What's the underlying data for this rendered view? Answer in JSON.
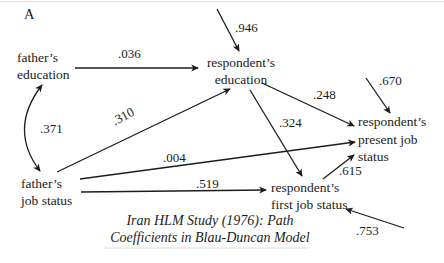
{
  "panel_label": "A",
  "caption": "Iran HLM Study (1976): Path\nCoefficients in Blau-Duncan Model",
  "nodes": {
    "fathers_education": {
      "label": "father’s\neducation"
    },
    "respondents_education": {
      "label": "respondent’s\neducation"
    },
    "respondents_present_job_status": {
      "label": "respondent’s\npresent job\nstatus"
    },
    "fathers_job_status": {
      "label": "father’s\njob status"
    },
    "respondents_first_job_status": {
      "label": "respondent’s\nfirst job status"
    }
  },
  "edges": [
    {
      "from": "father’s education",
      "to": "respondent’s education",
      "coef": ".036",
      "type": "path"
    },
    {
      "from": "residual",
      "to": "respondent’s education",
      "coef": ".946",
      "type": "residual"
    },
    {
      "from": "father’s job status",
      "to": "respondent’s education",
      "coef": ".310",
      "type": "path"
    },
    {
      "from": "father’s education",
      "to": "father’s job status",
      "coef": ".371",
      "type": "correlation"
    },
    {
      "from": "respondent’s education",
      "to": "respondent’s present job status",
      "coef": ".248",
      "type": "path"
    },
    {
      "from": "residual",
      "to": "respondent’s present job status",
      "coef": ".670",
      "type": "residual"
    },
    {
      "from": "respondent’s education",
      "to": "respondent’s first job status",
      "coef": ".324",
      "type": "path"
    },
    {
      "from": "father’s job status",
      "to": "respondent’s present job status",
      "coef": ".004",
      "type": "path"
    },
    {
      "from": "father’s job status",
      "to": "respondent’s first job status",
      "coef": ".519",
      "type": "path"
    },
    {
      "from": "respondent’s first job status",
      "to": "respondent’s present job status",
      "coef": ".615",
      "type": "path"
    },
    {
      "from": "residual",
      "to": "respondent’s first job status",
      "coef": ".753",
      "type": "residual"
    }
  ],
  "colors": {
    "ink": "#1c1c1c",
    "rule": "#dedede",
    "background": "#ffffff"
  }
}
